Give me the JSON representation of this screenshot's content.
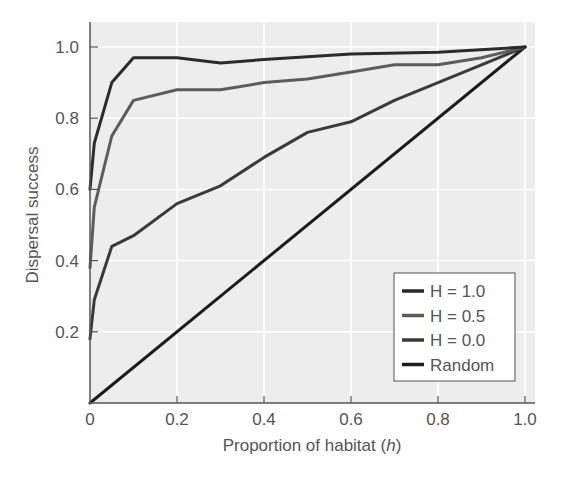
{
  "chart_data": {
    "type": "line",
    "title": "",
    "xlabel": "Proportion of habitat",
    "xlabel_italic": "h",
    "ylabel": "Dispersal success",
    "xlim": [
      0,
      1.0
    ],
    "ylim": [
      0,
      1.0
    ],
    "x_ticks": [
      0,
      0.2,
      0.4,
      0.6,
      0.8,
      1.0
    ],
    "x_tick_labels": [
      "0",
      "0.2",
      "0.4",
      "0.6",
      "0.8",
      "1.0"
    ],
    "y_ticks": [
      0.2,
      0.4,
      0.6,
      0.8,
      1.0
    ],
    "y_tick_labels": [
      "0.2",
      "0.4",
      "0.6",
      "0.8",
      "1.0"
    ],
    "grid": true,
    "legend_position": "lower right",
    "series": [
      {
        "name": "H = 1.0",
        "color": "#2b2b2b",
        "x": [
          0,
          0.01,
          0.05,
          0.1,
          0.2,
          0.3,
          0.4,
          0.6,
          0.8,
          1.0
        ],
        "values": [
          0.6,
          0.73,
          0.9,
          0.97,
          0.97,
          0.955,
          0.965,
          0.98,
          0.985,
          1.0
        ]
      },
      {
        "name": "H = 0.5",
        "color": "#5c5c5c",
        "x": [
          0,
          0.01,
          0.05,
          0.1,
          0.2,
          0.3,
          0.4,
          0.5,
          0.6,
          0.7,
          0.8,
          0.9,
          1.0
        ],
        "values": [
          0.38,
          0.55,
          0.75,
          0.85,
          0.88,
          0.88,
          0.9,
          0.91,
          0.93,
          0.95,
          0.95,
          0.97,
          1.0
        ]
      },
      {
        "name": "H = 0.0",
        "color": "#3a3a3a",
        "x": [
          0,
          0.01,
          0.05,
          0.1,
          0.2,
          0.3,
          0.4,
          0.5,
          0.6,
          0.7,
          0.8,
          0.9,
          1.0
        ],
        "values": [
          0.18,
          0.29,
          0.44,
          0.47,
          0.56,
          0.61,
          0.69,
          0.76,
          0.79,
          0.85,
          0.9,
          0.95,
          1.0
        ]
      },
      {
        "name": "Random",
        "color": "#1c1c1c",
        "x": [
          0,
          1.0
        ],
        "values": [
          0,
          1.0
        ]
      }
    ]
  },
  "colors": {
    "plot_background": "#ededed",
    "grid": "#ffffff",
    "axis": "#555555",
    "text": "#555555"
  }
}
